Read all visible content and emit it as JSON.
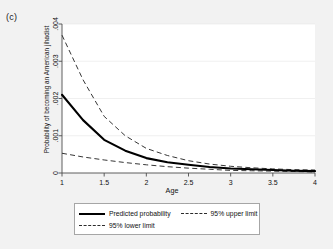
{
  "figure": {
    "panel_label": "(c)",
    "background_color": "#f2f2f2",
    "plot_background_color": "#ffffff"
  },
  "chart_data": {
    "type": "line",
    "title": "",
    "xlabel": "Age",
    "ylabel": "Probability of becoming an American jihadist",
    "xlim": [
      1,
      4
    ],
    "ylim": [
      0,
      0.004
    ],
    "xticks": [
      "1",
      "1.5",
      "2",
      "2.5",
      "3",
      "3.5",
      "4"
    ],
    "xtick_values": [
      1,
      1.5,
      2,
      2.5,
      3,
      3.5,
      4
    ],
    "yticks": [
      "0",
      ".001",
      ".002",
      ".003",
      ".004"
    ],
    "ytick_values": [
      0,
      0.001,
      0.002,
      0.003,
      0.004
    ],
    "grid": false,
    "legend_position": "bottom-outside",
    "x": [
      1,
      1.25,
      1.5,
      1.75,
      2,
      2.25,
      2.5,
      2.75,
      3,
      3.25,
      3.5,
      3.75,
      4
    ],
    "series": [
      {
        "name": "Predicted probability",
        "style": "solid",
        "color": "#000000",
        "values": [
          0.0021,
          0.00142,
          0.00089,
          0.0006,
          0.0004,
          0.00029,
          0.00022,
          0.00016,
          0.00012,
          0.0001,
          8e-05,
          6e-05,
          5e-05
        ]
      },
      {
        "name": "95% upper limit",
        "style": "dashed",
        "color": "#2b2b2b",
        "values": [
          0.0037,
          0.0025,
          0.00152,
          0.001,
          0.00066,
          0.00047,
          0.00033,
          0.00024,
          0.00018,
          0.00014,
          0.00011,
          9e-05,
          8e-05
        ]
      },
      {
        "name": "95% lower limit",
        "style": "dashed",
        "color": "#2b2b2b",
        "values": [
          0.00053,
          0.00043,
          0.00035,
          0.00028,
          0.00022,
          0.00017,
          0.00013,
          0.0001,
          7e-05,
          6e-05,
          5e-05,
          4e-05,
          3e-05
        ]
      }
    ]
  },
  "legend": {
    "entries": [
      {
        "label": "Predicted probability",
        "style": "solid"
      },
      {
        "label": "95% upper limit",
        "style": "dashed"
      },
      {
        "label": "95% lower limit",
        "style": "dashed"
      }
    ]
  }
}
